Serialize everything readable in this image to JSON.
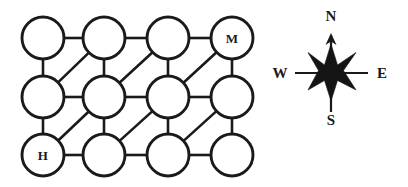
{
  "figure": {
    "background_color": "#ffffff",
    "stroke_color": "#1a1a1a"
  },
  "diagram": {
    "type": "node-link-grid-graph",
    "rows": 3,
    "columns": 4,
    "node_radius": 21,
    "geometry": {
      "column_x": [
        43,
        104,
        168,
        232
      ],
      "row_y": [
        38,
        97,
        155
      ]
    },
    "nodes": [
      {
        "id": "r0c0",
        "row": 0,
        "col": 0,
        "cx": 43,
        "cy": 38,
        "label": ""
      },
      {
        "id": "r0c1",
        "row": 0,
        "col": 1,
        "cx": 104,
        "cy": 38,
        "label": ""
      },
      {
        "id": "r0c2",
        "row": 0,
        "col": 2,
        "cx": 168,
        "cy": 38,
        "label": ""
      },
      {
        "id": "r0c3",
        "row": 0,
        "col": 3,
        "cx": 232,
        "cy": 38,
        "label": "M"
      },
      {
        "id": "r1c0",
        "row": 1,
        "col": 0,
        "cx": 43,
        "cy": 97,
        "label": ""
      },
      {
        "id": "r1c1",
        "row": 1,
        "col": 1,
        "cx": 104,
        "cy": 97,
        "label": ""
      },
      {
        "id": "r1c2",
        "row": 1,
        "col": 2,
        "cx": 168,
        "cy": 97,
        "label": ""
      },
      {
        "id": "r1c3",
        "row": 1,
        "col": 3,
        "cx": 232,
        "cy": 97,
        "label": ""
      },
      {
        "id": "r2c0",
        "row": 2,
        "col": 0,
        "cx": 43,
        "cy": 155,
        "label": "H"
      },
      {
        "id": "r2c1",
        "row": 2,
        "col": 1,
        "cx": 104,
        "cy": 155,
        "label": ""
      },
      {
        "id": "r2c2",
        "row": 2,
        "col": 2,
        "cx": 168,
        "cy": 155,
        "label": ""
      },
      {
        "id": "r2c3",
        "row": 2,
        "col": 3,
        "cx": 232,
        "cy": 155,
        "label": ""
      }
    ],
    "edges": [
      {
        "from": "r0c0",
        "to": "r0c1",
        "kind": "horizontal"
      },
      {
        "from": "r0c1",
        "to": "r0c2",
        "kind": "horizontal"
      },
      {
        "from": "r0c2",
        "to": "r0c3",
        "kind": "horizontal"
      },
      {
        "from": "r1c0",
        "to": "r1c1",
        "kind": "horizontal"
      },
      {
        "from": "r1c1",
        "to": "r1c2",
        "kind": "horizontal"
      },
      {
        "from": "r1c2",
        "to": "r1c3",
        "kind": "horizontal"
      },
      {
        "from": "r2c0",
        "to": "r2c1",
        "kind": "horizontal"
      },
      {
        "from": "r2c1",
        "to": "r2c2",
        "kind": "horizontal"
      },
      {
        "from": "r2c2",
        "to": "r2c3",
        "kind": "horizontal"
      },
      {
        "from": "r0c0",
        "to": "r1c0",
        "kind": "vertical"
      },
      {
        "from": "r0c1",
        "to": "r1c1",
        "kind": "vertical"
      },
      {
        "from": "r0c2",
        "to": "r1c2",
        "kind": "vertical"
      },
      {
        "from": "r0c3",
        "to": "r1c3",
        "kind": "vertical"
      },
      {
        "from": "r1c0",
        "to": "r2c0",
        "kind": "vertical"
      },
      {
        "from": "r1c1",
        "to": "r2c1",
        "kind": "vertical"
      },
      {
        "from": "r1c2",
        "to": "r2c2",
        "kind": "vertical"
      },
      {
        "from": "r1c3",
        "to": "r2c3",
        "kind": "vertical"
      },
      {
        "from": "r1c0",
        "to": "r0c1",
        "kind": "diagonal"
      },
      {
        "from": "r1c1",
        "to": "r0c2",
        "kind": "diagonal"
      },
      {
        "from": "r1c2",
        "to": "r0c3",
        "kind": "diagonal"
      },
      {
        "from": "r2c0",
        "to": "r1c1",
        "kind": "diagonal"
      },
      {
        "from": "r2c1",
        "to": "r1c2",
        "kind": "diagonal"
      },
      {
        "from": "r2c2",
        "to": "r1c3",
        "kind": "diagonal"
      }
    ],
    "labeled_nodes": {
      "start": {
        "id": "r2c0",
        "label": "H"
      },
      "goal": {
        "id": "r0c3",
        "label": "M"
      }
    }
  },
  "compass": {
    "name": "compass-rose",
    "center": {
      "x": 63,
      "y": 73
    },
    "labels": {
      "north": "N",
      "east": "E",
      "south": "S",
      "west": "W"
    },
    "label_positions": {
      "north": {
        "x": 63,
        "y": 16
      },
      "east": {
        "x": 114,
        "y": 73
      },
      "south": {
        "x": 63,
        "y": 120
      },
      "west": {
        "x": 12,
        "y": 73
      }
    },
    "has_north_arrow": true,
    "star_points": 8,
    "star_color": "#141414"
  }
}
